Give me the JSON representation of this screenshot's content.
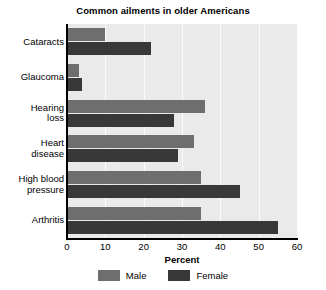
{
  "chart_data": {
    "type": "bar",
    "orientation": "horizontal",
    "title": "Common ailments in older Americans",
    "xlabel": "Percent",
    "ylabel": "",
    "xlim": [
      0,
      60
    ],
    "xticks": [
      0,
      10,
      20,
      30,
      40,
      50,
      60
    ],
    "xticklabels": [
      "0",
      "10",
      "20",
      "30",
      "40",
      "50",
      "60"
    ],
    "grid": "vertical",
    "legend_position": "bottom-center",
    "categories": [
      "Cataracts",
      "Glaucoma",
      "Hearing\nloss",
      "Heart\ndisease",
      "High blood\npressure",
      "Arthritis"
    ],
    "series": [
      {
        "name": "Male",
        "color": "#6e6e6e",
        "values": [
          10,
          3,
          36,
          33,
          35,
          35
        ]
      },
      {
        "name": "Female",
        "color": "#383838",
        "values": [
          22,
          4,
          28,
          29,
          45,
          55
        ]
      }
    ],
    "plot_background": "#eaeaea",
    "gridline_color": "#fbfbfb",
    "axis_color": "#000000"
  }
}
